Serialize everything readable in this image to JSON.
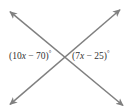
{
  "figure": {
    "kind": "intersecting-lines-angle-diagram",
    "background_color": "#ffffff",
    "line_color": "#808080",
    "text_color": "#333333",
    "width": 129,
    "height": 112,
    "intersection": {
      "x": 69,
      "y": 57
    },
    "lines": [
      {
        "name": "line-tl-br",
        "from": {
          "x": 8,
          "y": 10
        },
        "to": {
          "x": 125,
          "y": 107
        },
        "arrowheads": [
          "start",
          "end"
        ]
      },
      {
        "name": "line-bl-tr",
        "from": {
          "x": 8,
          "y": 106
        },
        "to": {
          "x": 122,
          "y": 8
        },
        "arrowheads": [
          "start",
          "end"
        ]
      }
    ],
    "labels": {
      "left": {
        "name": "left-angle-label",
        "open_paren": "(",
        "coefficient": "10",
        "variable": "x",
        "operator": "−",
        "constant": "70",
        "close_paren": ")",
        "degree": "°",
        "full_text": "(10x − 70)°"
      },
      "right": {
        "name": "right-angle-label",
        "open_paren": "(",
        "coefficient": "7",
        "variable": "x",
        "operator": "−",
        "constant": "25",
        "close_paren": ")",
        "degree": "°",
        "full_text": "(7x − 25)°"
      }
    }
  }
}
